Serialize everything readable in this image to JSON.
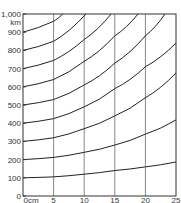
{
  "chart_data": {
    "type": "line",
    "title": "",
    "xlabel": "cm",
    "ylabel": "km",
    "x_unit_label": "0cm",
    "y_unit_label": "km",
    "xlim": [
      0,
      25
    ],
    "ylim": [
      0,
      1000
    ],
    "x_ticks": [
      "0cm",
      "5",
      "10",
      "15",
      "20",
      "25"
    ],
    "y_ticks": [
      "0",
      "100",
      "200",
      "300",
      "400",
      "500",
      "600",
      "700",
      "800",
      "900",
      "1,000"
    ],
    "grid": {
      "vertical": true,
      "horizontal": false
    },
    "legend": null,
    "series": [
      {
        "name": "100",
        "x": [
          0,
          5,
          10,
          15,
          20,
          25
        ],
        "values": [
          100,
          105,
          120,
          140,
          160,
          187
        ]
      },
      {
        "name": "200",
        "x": [
          0,
          5,
          10,
          15,
          20,
          25
        ],
        "values": [
          200,
          212,
          240,
          280,
          340,
          418
        ]
      },
      {
        "name": "300",
        "x": [
          0,
          5,
          10,
          15,
          20,
          25
        ],
        "values": [
          300,
          320,
          370,
          440,
          540,
          676
        ]
      },
      {
        "name": "400",
        "x": [
          0,
          5,
          10,
          15,
          20,
          25
        ],
        "values": [
          400,
          425,
          490,
          590,
          710,
          840
        ]
      },
      {
        "name": "500",
        "x": [
          0,
          5,
          10,
          15,
          20,
          23.2
        ],
        "values": [
          500,
          530,
          610,
          730,
          880,
          1000
        ]
      },
      {
        "name": "600",
        "x": [
          0,
          5,
          10,
          15,
          18.8
        ],
        "values": [
          600,
          640,
          740,
          880,
          1000
        ]
      },
      {
        "name": "700",
        "x": [
          0,
          5,
          10,
          14.4
        ],
        "values": [
          700,
          745,
          860,
          1000
        ]
      },
      {
        "name": "800",
        "x": [
          0,
          5,
          10.3
        ],
        "values": [
          800,
          850,
          1000
        ]
      },
      {
        "name": "900",
        "x": [
          0,
          5,
          6.5
        ],
        "values": [
          900,
          960,
          1000
        ]
      }
    ]
  },
  "colors": {
    "curve": "#222222",
    "grid": "#888888",
    "frame": "#333333",
    "background": "#ffffff"
  }
}
